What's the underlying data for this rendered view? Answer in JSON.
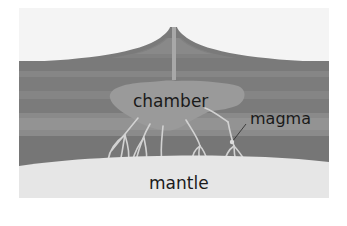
{
  "diagram": {
    "labels": {
      "chamber": "chamber",
      "magma": "magma",
      "mantle": "mantle"
    },
    "colors": {
      "background": "#ffffff",
      "sky": "#f4f4f4",
      "crust_dark": "#767676",
      "crust_mid": "#828282",
      "crust_light": "#8e8e8e",
      "chamber": "#9a9a9a",
      "conduit": "#a8a8a8",
      "dikes": "#d2d2d2",
      "mantle": "#e6e6e6",
      "label_text": "#1a1a1a"
    }
  }
}
